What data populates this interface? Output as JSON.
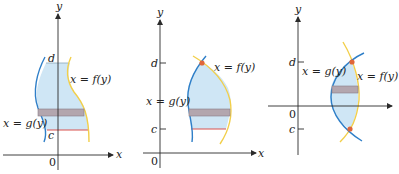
{
  "colors": {
    "axis": "#2b2b2b",
    "region_fill": "#cfe6f5",
    "g_curve": "#2f7fc8",
    "f_curve": "#f2cf4a",
    "strip_fill": "#b3a6ae",
    "strip_stroke": "#8a7d85",
    "c_line": "#d9534f",
    "intersection_dot": "#e0663a"
  },
  "panels": [
    {
      "id": "panel-1",
      "axis_x_label": "x",
      "axis_y_label": "y",
      "origin_label": "0",
      "d_label": "d",
      "c_label": "c",
      "f_label": "x = f(y)",
      "g_label": "x = g(y)"
    },
    {
      "id": "panel-2",
      "axis_x_label": "x",
      "axis_y_label": "y",
      "origin_label": "0",
      "d_label": "d",
      "c_label": "c",
      "f_label": "x = f(y)",
      "g_label": "x = g(y)"
    },
    {
      "id": "panel-3",
      "axis_x_label": "x",
      "axis_y_label": "y",
      "origin_label": "0",
      "d_label": "d",
      "c_label": "c",
      "f_label": "x = f(y)",
      "g_label": "x = g(y)"
    }
  ]
}
